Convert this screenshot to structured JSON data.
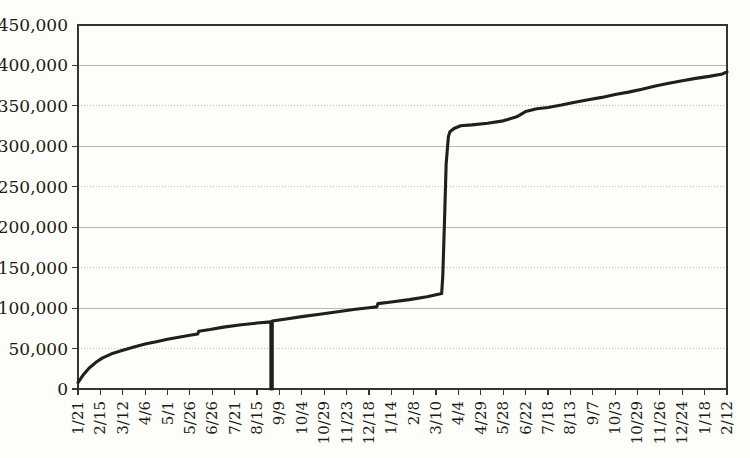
{
  "chart_data": {
    "type": "line",
    "title": "",
    "subtitle": "",
    "xlabel": "",
    "ylabel": "",
    "ylim": [
      0,
      450000
    ],
    "y_ticks": [
      0,
      50000,
      100000,
      150000,
      200000,
      250000,
      300000,
      350000,
      400000,
      450000
    ],
    "y_tick_labels": [
      "0",
      "50,000",
      "100,000",
      "150,000",
      "200,000",
      "250,000",
      "300,000",
      "350,000",
      "400,000",
      "450,000"
    ],
    "grid": true,
    "grid_axis": "y",
    "legend": "none",
    "line_color": "#231f18",
    "background_color": "#fdfdfa",
    "grid_color": "#bdbdb7",
    "axis_color": "#35352f",
    "categories": [
      "1/21",
      "2/15",
      "3/12",
      "4/6",
      "5/1",
      "5/26",
      "6/26",
      "7/21",
      "8/15",
      "9/9",
      "10/4",
      "10/29",
      "11/23",
      "12/18",
      "1/14",
      "2/8",
      "3/10",
      "4/4",
      "4/29",
      "5/28",
      "6/22",
      "7/18",
      "8/13",
      "9/7",
      "10/3",
      "10/29",
      "11/26",
      "12/24",
      "1/18",
      "2/12"
    ],
    "series": [
      {
        "name": "cumulative total",
        "values": [
          8000,
          30000,
          42000,
          50000,
          57000,
          63000,
          71000,
          76000,
          72000,
          78000,
          83000,
          89000,
          95000,
          104000,
          110000,
          117000,
          325000,
          332000,
          336000,
          345000,
          350000,
          354000,
          358000,
          363000,
          368000,
          374000,
          380000,
          385000,
          389000,
          392000
        ]
      }
    ],
    "anomaly": {
      "label": "drop-to-zero spike",
      "x_category": "8/15",
      "value": 0
    },
    "points": [
      [
        0,
        8000
      ],
      [
        0.25,
        18000
      ],
      [
        0.5,
        26000
      ],
      [
        0.8,
        33000
      ],
      [
        1.1,
        38500
      ],
      [
        1.5,
        43500
      ],
      [
        2.0,
        48000
      ],
      [
        2.5,
        52000
      ],
      [
        3.0,
        55500
      ],
      [
        3.5,
        58500
      ],
      [
        4.0,
        61500
      ],
      [
        4.5,
        64000
      ],
      [
        5.0,
        66500
      ],
      [
        5.35,
        68000
      ],
      [
        5.4,
        71500
      ],
      [
        5.9,
        73500
      ],
      [
        6.5,
        76500
      ],
      [
        7.3,
        79500
      ],
      [
        8.0,
        81500
      ],
      [
        8.62,
        83000
      ],
      [
        8.62,
        0
      ],
      [
        8.68,
        0
      ],
      [
        8.68,
        84000
      ],
      [
        9.3,
        86500
      ],
      [
        10.0,
        89500
      ],
      [
        10.8,
        92500
      ],
      [
        11.6,
        95500
      ],
      [
        12.4,
        98500
      ],
      [
        13.0,
        100500
      ],
      [
        13.35,
        101500
      ],
      [
        13.4,
        105500
      ],
      [
        14.0,
        107500
      ],
      [
        14.8,
        110500
      ],
      [
        15.6,
        114000
      ],
      [
        16.0,
        116500
      ],
      [
        16.25,
        118000
      ],
      [
        16.3,
        140000
      ],
      [
        16.38,
        210000
      ],
      [
        16.45,
        278000
      ],
      [
        16.55,
        312000
      ],
      [
        16.62,
        318000
      ],
      [
        16.8,
        322000
      ],
      [
        17.1,
        325500
      ],
      [
        17.6,
        326500
      ],
      [
        18.3,
        328500
      ],
      [
        19.0,
        331500
      ],
      [
        19.6,
        336500
      ],
      [
        20.0,
        343000
      ],
      [
        20.5,
        346500
      ],
      [
        21.0,
        348000
      ],
      [
        21.6,
        351000
      ],
      [
        22.2,
        354500
      ],
      [
        22.8,
        357500
      ],
      [
        23.4,
        360500
      ],
      [
        24.0,
        364000
      ],
      [
        24.6,
        367000
      ],
      [
        25.2,
        370500
      ],
      [
        25.8,
        374500
      ],
      [
        26.4,
        378000
      ],
      [
        27.0,
        381000
      ],
      [
        27.6,
        384000
      ],
      [
        28.2,
        386500
      ],
      [
        28.8,
        389500
      ],
      [
        29.0,
        392000
      ]
    ]
  },
  "axes": {
    "plot_left": 78,
    "plot_right": 727,
    "plot_top": 25,
    "plot_bottom": 389
  }
}
